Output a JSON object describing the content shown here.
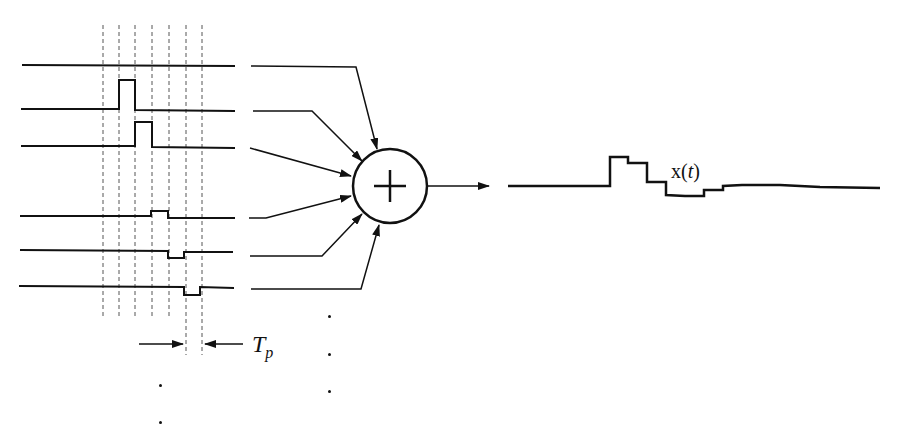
{
  "diagram": {
    "output_label_prefix": "x(",
    "output_label_var": "t",
    "output_label_suffix": ")",
    "period_label_main": "T",
    "period_label_sub": "p",
    "summer_symbol": "+",
    "colors": {
      "stroke": "#111111",
      "background": "#ffffff",
      "dashed_grid": "#555555"
    },
    "dashed_grid_x": [
      103,
      119,
      135,
      152,
      169,
      186,
      202
    ],
    "input_signals": [
      {
        "name": "signal-1",
        "baseline_y": 65,
        "pulse": null
      },
      {
        "name": "signal-2",
        "baseline_y": 110,
        "pulse": {
          "x0": 119,
          "x1": 135,
          "y": 80
        }
      },
      {
        "name": "signal-3",
        "baseline_y": 147,
        "pulse": {
          "x0": 135,
          "x1": 152,
          "y": 122
        }
      },
      {
        "name": "signal-4",
        "baseline_y": 217,
        "pulse": {
          "x0": 151,
          "x1": 168,
          "y": 211
        }
      },
      {
        "name": "signal-5",
        "baseline_y": 251,
        "pulse": {
          "x0": 168,
          "x1": 184,
          "y": 258
        }
      },
      {
        "name": "signal-6",
        "baseline_y": 287,
        "pulse": {
          "x0": 184,
          "x1": 200,
          "y": 295
        }
      }
    ],
    "summer": {
      "cx": 390,
      "cy": 186,
      "r": 37
    },
    "output_waveform_points": [
      [
        508,
        186
      ],
      [
        610,
        186
      ],
      [
        610,
        157
      ],
      [
        628,
        157
      ],
      [
        628,
        163
      ],
      [
        647,
        163
      ],
      [
        647,
        182
      ],
      [
        666,
        182
      ],
      [
        666,
        195
      ],
      [
        685,
        196
      ],
      [
        704,
        196
      ],
      [
        704,
        190
      ],
      [
        723,
        190
      ],
      [
        723,
        186
      ],
      [
        742,
        185
      ],
      [
        780,
        185
      ],
      [
        820,
        187
      ],
      [
        880,
        188
      ]
    ],
    "ellipsis_dots": [
      {
        "x": 160,
        "y": 385
      },
      {
        "x": 160,
        "y": 422
      },
      {
        "x": 329,
        "y": 316
      },
      {
        "x": 329,
        "y": 354
      },
      {
        "x": 329,
        "y": 391
      }
    ]
  }
}
